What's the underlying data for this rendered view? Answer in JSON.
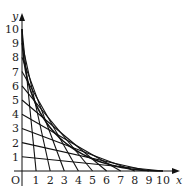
{
  "diagram": {
    "x_axis_label": "x",
    "y_axis_label": "y",
    "origin_label": "O",
    "x_ticks": [
      "1",
      "2",
      "3",
      "4",
      "5",
      "6",
      "7",
      "8",
      "9",
      "10"
    ],
    "y_ticks": [
      "1",
      "2",
      "3",
      "4",
      "5",
      "6",
      "7",
      "8",
      "9",
      "10"
    ],
    "segments": [
      {
        "y_intercept": 1,
        "x_intercept": 10
      },
      {
        "y_intercept": 2,
        "x_intercept": 9
      },
      {
        "y_intercept": 3,
        "x_intercept": 8
      },
      {
        "y_intercept": 4,
        "x_intercept": 7
      },
      {
        "y_intercept": 5,
        "x_intercept": 6
      },
      {
        "y_intercept": 6,
        "x_intercept": 5
      },
      {
        "y_intercept": 7,
        "x_intercept": 4
      },
      {
        "y_intercept": 8,
        "x_intercept": 3
      },
      {
        "y_intercept": 9,
        "x_intercept": 2
      },
      {
        "y_intercept": 10,
        "x_intercept": 1
      }
    ],
    "envelope": "parabola tangent to all segments, from (0,10) to (10,0)",
    "line_color": "#111111"
  }
}
